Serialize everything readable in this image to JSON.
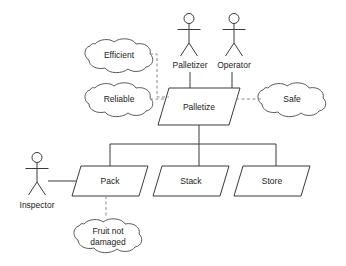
{
  "diagram": {
    "type": "uml-use-case-goal-diagram",
    "background_color": "#ffffff",
    "line_color": "#3a3a3a",
    "dashed_line_color": "#8a8a8a",
    "text_color": "#222222",
    "actors": [
      {
        "id": "palletizer",
        "label": "Palletizer"
      },
      {
        "id": "operator",
        "label": "Operator"
      },
      {
        "id": "inspector",
        "label": "Inspector"
      }
    ],
    "use_cases": [
      {
        "id": "palletize",
        "label": "Palletize"
      },
      {
        "id": "pack",
        "label": "Pack"
      },
      {
        "id": "stack",
        "label": "Stack"
      },
      {
        "id": "store",
        "label": "Store"
      }
    ],
    "soft_goals": [
      {
        "id": "efficient",
        "label": "Efficient"
      },
      {
        "id": "reliable",
        "label": "Reliable"
      },
      {
        "id": "safe",
        "label": "Safe"
      },
      {
        "id": "fruit-not-damaged",
        "label_line1": "Fruit not",
        "label_line2": "damaged"
      }
    ]
  }
}
